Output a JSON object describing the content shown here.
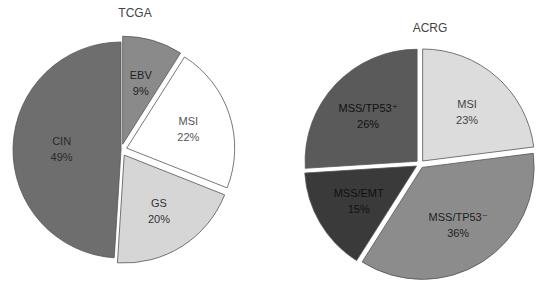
{
  "chart_data": [
    {
      "type": "pie",
      "title": "TCGA",
      "categories": [
        "EBV",
        "MSI",
        "GS",
        "CIN"
      ],
      "values": [
        9,
        22,
        20,
        49
      ],
      "labels": [
        "9%",
        "22%",
        "20%",
        "49%"
      ],
      "colors": [
        "#8a8a8a",
        "#ffffff",
        "#d6d6d6",
        "#6e6e6e"
      ],
      "label_colors": [
        "#222222",
        "#555555",
        "#333333",
        "#2a2a2a"
      ],
      "exploded": [
        true,
        true,
        true,
        false
      ],
      "start_angle_deg": 0,
      "direction": "clockwise",
      "center": [
        121,
        150
      ],
      "radius": 108,
      "explode_px": 6
    },
    {
      "type": "pie",
      "title": "ACRG",
      "categories": [
        "MSI",
        "MSS/TP53⁻",
        "MSS/EMT",
        "MSS/TP53⁺"
      ],
      "values": [
        23,
        36,
        15,
        26
      ],
      "labels": [
        "23%",
        "36%",
        "15%",
        "26%"
      ],
      "colors": [
        "#dcdcdc",
        "#8c8c8c",
        "#3a3a3a",
        "#5a5a5a"
      ],
      "label_colors": [
        "#444444",
        "#222222",
        "#111111",
        "#111111"
      ],
      "exploded": [
        true,
        true,
        true,
        true
      ],
      "start_angle_deg": 0,
      "direction": "clockwise",
      "center": [
        420,
        164
      ],
      "radius": 112,
      "explode_px": 4
    }
  ],
  "charts": {
    "tcga": {
      "title": "TCGA"
    },
    "acrg": {
      "title": "ACRG"
    }
  }
}
